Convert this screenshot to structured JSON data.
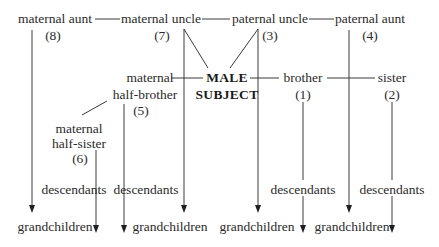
{
  "diagram": {
    "nodes": {
      "maternal_aunt": {
        "label": "maternal aunt",
        "number": "(8)"
      },
      "maternal_uncle": {
        "label": "maternal uncle",
        "number": "(7)"
      },
      "paternal_uncle": {
        "label": "paternal uncle",
        "number": "(3)"
      },
      "paternal_aunt": {
        "label": "paternal aunt",
        "number": "(4)"
      },
      "maternal_half_brother": {
        "line1": "maternal",
        "line2": "half-brother",
        "number": "(5)"
      },
      "subject": {
        "line1": "MALE",
        "line2": "SUBJECT"
      },
      "brother": {
        "label": "brother",
        "number": "(1)"
      },
      "sister": {
        "label": "sister",
        "number": "(2)"
      },
      "maternal_half_sister": {
        "line1": "maternal",
        "line2": "half-sister",
        "number": "(6)"
      }
    },
    "descendants_label": "descendants",
    "grandchildren_label": "grandchildren",
    "descendants": [
      "descendants",
      "descendants",
      "descendants",
      "descendants"
    ],
    "grandchildren": [
      "grandchildren",
      "grandchildren",
      "grandchildren",
      "grandchildren"
    ],
    "line_color": "#3a3a3a",
    "text_color": "#2b2b2b"
  }
}
